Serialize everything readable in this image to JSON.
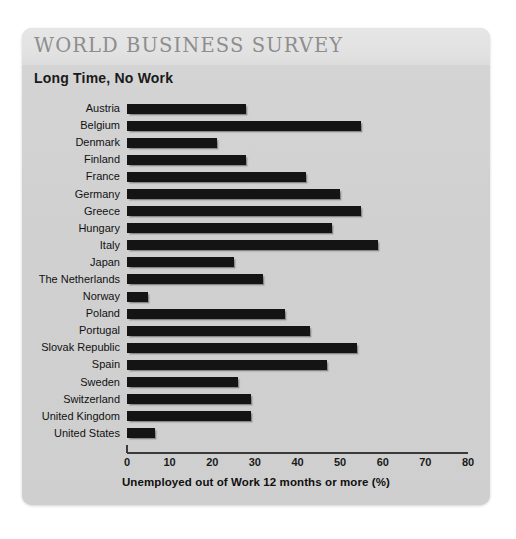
{
  "card": {
    "survey_title": "WORLD BUSINESS SURVEY",
    "chart_title": "Long Time, No Work"
  },
  "chart_data": {
    "type": "bar",
    "orientation": "horizontal",
    "title": "Long Time, No Work",
    "xlabel": "Unemployed out of Work 12 months or more (%)",
    "ylabel": "",
    "xlim": [
      0,
      80
    ],
    "xticks": [
      0,
      10,
      20,
      30,
      40,
      50,
      60,
      70,
      80
    ],
    "xtick_labels": [
      "0",
      "10",
      "20",
      "30",
      "40",
      "50",
      "60",
      "70",
      "80"
    ],
    "grid": false,
    "legend": "none",
    "bar_color": "#141414",
    "categories": [
      "Austria",
      "Belgium",
      "Denmark",
      "Finland",
      "France",
      "Germany",
      "Greece",
      "Hungary",
      "Italy",
      "Japan",
      "The Netherlands",
      "Norway",
      "Poland",
      "Portugal",
      "Slovak Republic",
      "Spain",
      "Sweden",
      "Switzerland",
      "United Kingdom",
      "United States"
    ],
    "values": [
      28,
      55,
      21,
      28,
      42,
      50,
      55,
      48,
      59,
      25,
      32,
      5,
      37,
      43,
      54,
      47,
      26,
      29,
      29,
      6.5
    ]
  }
}
